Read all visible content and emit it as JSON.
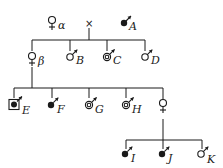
{
  "diagram": {
    "type": "pedigree",
    "generation_1": {
      "female": {
        "label": "α",
        "symbol": "female"
      },
      "cross": "×",
      "male": {
        "label": "A",
        "symbol": "male-filled-dot"
      }
    },
    "generation_2": [
      {
        "label": "β",
        "symbol": "female"
      },
      {
        "label": "B",
        "symbol": "male"
      },
      {
        "label": "C",
        "symbol": "male-double-circle"
      },
      {
        "label": "D",
        "symbol": "male"
      }
    ],
    "generation_3": [
      {
        "label": "E",
        "symbol": "male-boxed-filled-dot"
      },
      {
        "label": "F",
        "symbol": "male-filled-dot"
      },
      {
        "label": "G",
        "symbol": "male-double-circle"
      },
      {
        "label": "H",
        "symbol": "male-double-circle"
      },
      {
        "label": "",
        "symbol": "female"
      }
    ],
    "generation_4": [
      {
        "label": "I",
        "symbol": "male-filled-dot"
      },
      {
        "label": "J",
        "symbol": "male-filled-dot"
      },
      {
        "label": "K",
        "symbol": "male"
      }
    ],
    "colors": {
      "ink": "#1a1a1a",
      "background": "#ffffff"
    }
  }
}
